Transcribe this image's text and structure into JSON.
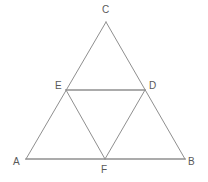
{
  "figure": {
    "background_color": "#ffffff",
    "stroke_color": "#8c8c8c",
    "outer_stroke_color": "#8f8f8f",
    "label_color": "#595959",
    "canvas": {
      "width": 208,
      "height": 182
    },
    "points": {
      "A": {
        "label": "A",
        "x": 26,
        "y": 159,
        "label_x": 13,
        "label_y": 157
      },
      "B": {
        "label": "B",
        "x": 185,
        "y": 159,
        "label_x": 188,
        "label_y": 157
      },
      "C": {
        "label": "C",
        "x": 106,
        "y": 22,
        "label_x": 102,
        "label_y": 5
      },
      "D": {
        "label": "D",
        "x": 145,
        "y": 90,
        "label_x": 149,
        "label_y": 81
      },
      "E": {
        "label": "E",
        "x": 66,
        "y": 90,
        "label_x": 55,
        "label_y": 81
      },
      "F": {
        "label": "F",
        "x": 105,
        "y": 159,
        "label_x": 101,
        "label_y": 165
      }
    },
    "segments": [
      {
        "name": "side-AB",
        "from": "A",
        "to": "B"
      },
      {
        "name": "side-AC",
        "from": "A",
        "to": "C"
      },
      {
        "name": "side-BC",
        "from": "B",
        "to": "C"
      },
      {
        "name": "midline-ED",
        "from": "E",
        "to": "D"
      },
      {
        "name": "midline-EF",
        "from": "E",
        "to": "F"
      },
      {
        "name": "midline-DF",
        "from": "D",
        "to": "F"
      }
    ]
  }
}
